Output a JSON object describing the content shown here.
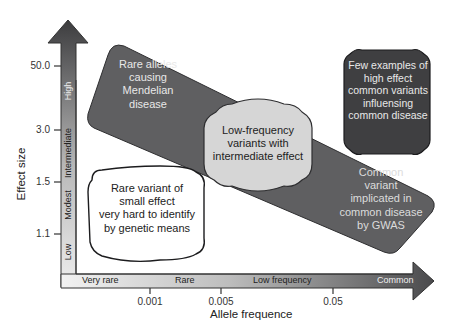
{
  "diagram": {
    "y_axis": {
      "title": "Effect size",
      "ticks": [
        "50.0",
        "3.0",
        "1.5",
        "1.1"
      ],
      "bands": [
        "High",
        "Intermediate",
        "Modest",
        "Low"
      ]
    },
    "x_axis": {
      "title": "Allele frequence",
      "ticks": [
        "0.001",
        "0.005",
        "0.05"
      ],
      "bands": [
        "Very rare",
        "Rare",
        "Low frequency",
        "Common"
      ]
    },
    "regions": {
      "mendelian": "Rare alleles causing Mendelian disease",
      "mendelian_lines": [
        "Rare alleles",
        "causing",
        "Mendelian",
        "disease"
      ],
      "few_examples_lines": [
        "Few examples of",
        "high effect",
        "common variants",
        "influensing",
        "common disease"
      ],
      "low_freq_lines": [
        "Low-frequency",
        "variants with",
        "intermediate effect"
      ],
      "gwas_lines": [
        "Common",
        "variant",
        "implicated in",
        "common disease",
        "by GWAS"
      ],
      "rare_small_lines": [
        "Rare variant of",
        "small effect",
        "very hard to identify",
        "by genetic means"
      ]
    },
    "colors": {
      "dark_fill": "#4a4a4c",
      "band_fill": "#6b6b6d",
      "light_fill": "#d9d9d9",
      "axis_dark": "#3a3a3c",
      "axis_light": "#e6e6e6"
    }
  }
}
